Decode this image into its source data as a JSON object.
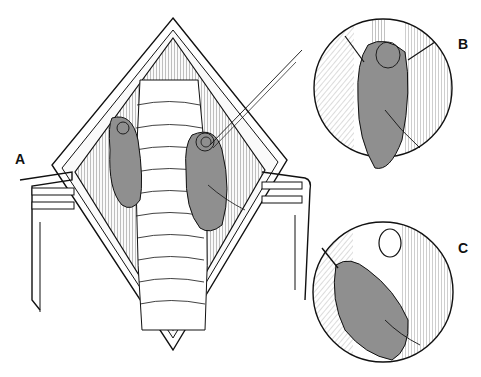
{
  "figure": {
    "panels": [
      {
        "label": "A",
        "description": "Open surgical incision with retractors exposing trachea and two gray organs (thyroid lobes/parathyroid)"
      },
      {
        "label": "B",
        "description": "Circular magnified view of gray organ with ligature loop at top"
      },
      {
        "label": "C",
        "description": "Circular magnified view of gray organ being reflected, with cut vessel stump"
      }
    ],
    "colors": {
      "organ_fill": "#8f8f8f",
      "line": "#1a1a1a",
      "background": "#ffffff",
      "tissue_shade": "#d8d8d8"
    }
  }
}
